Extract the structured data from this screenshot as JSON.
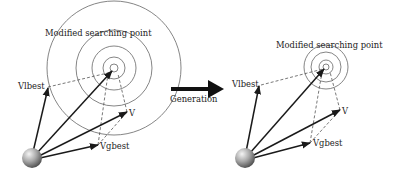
{
  "colors": {
    "ink": "#1a1a1a",
    "dashed": "#555555",
    "circle": "#666666",
    "sphere_light": "#f2f2f2",
    "sphere_dark": "#555555"
  },
  "transition": {
    "label": "Generation"
  },
  "panels": [
    {
      "id": "before",
      "title": "Modified searching point",
      "labels": {
        "vlbest": "Vlbest",
        "v": "V",
        "vgbest": "Vgbest"
      },
      "target": {
        "cx": 114,
        "cy": 68
      },
      "ring_radii": [
        4,
        11,
        22,
        38,
        67
      ],
      "origin": {
        "cx": 32,
        "cy": 158,
        "r": 10
      },
      "vectors": {
        "vlbest": {
          "x": 48,
          "y": 87
        },
        "v": {
          "x": 127,
          "y": 112
        },
        "vgbest": {
          "x": 98,
          "y": 145
        }
      }
    },
    {
      "id": "after",
      "title": "Modified searching point",
      "labels": {
        "vlbest": "Vlbest",
        "v": "V",
        "vgbest": "Vgbest"
      },
      "target": {
        "cx": 326,
        "cy": 67
      },
      "ring_radii": [
        3,
        7,
        15,
        22
      ],
      "origin": {
        "cx": 245,
        "cy": 158,
        "r": 10
      },
      "vectors": {
        "vlbest": {
          "x": 259,
          "y": 85
        },
        "v": {
          "x": 340,
          "y": 110
        },
        "vgbest": {
          "x": 310,
          "y": 143
        }
      }
    }
  ]
}
